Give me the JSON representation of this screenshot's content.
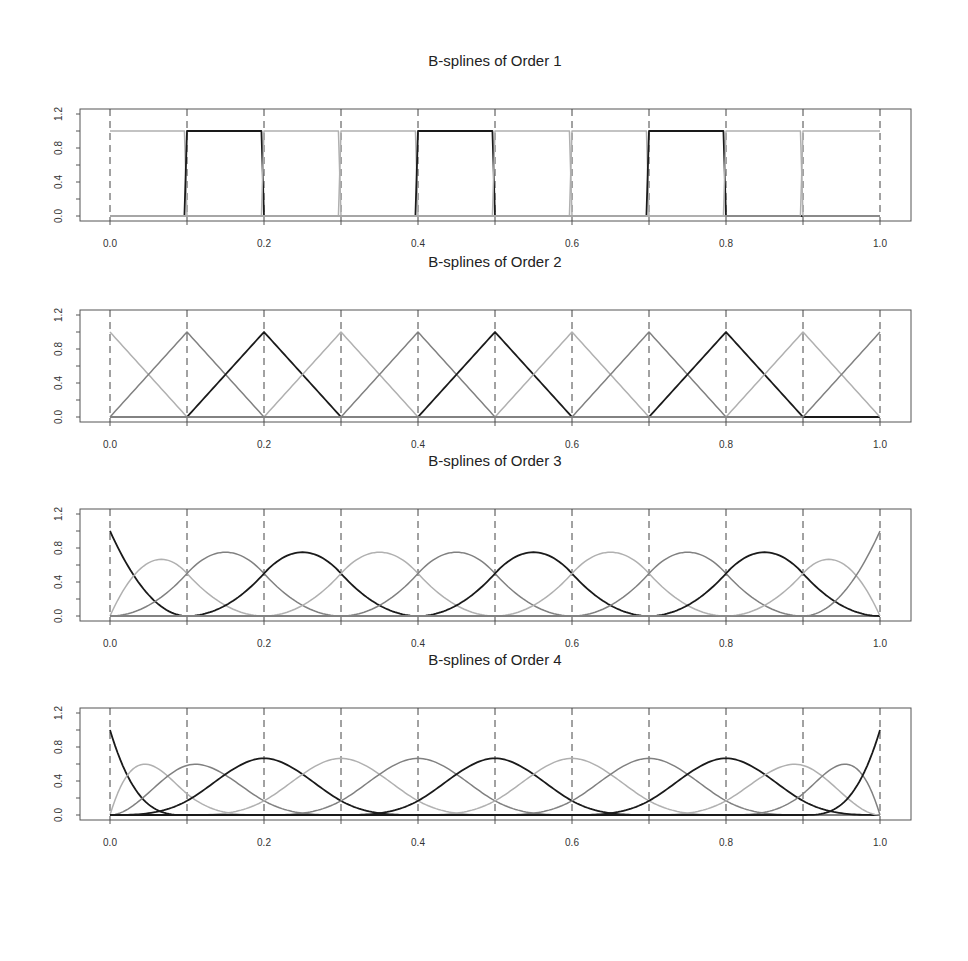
{
  "chart_data": [
    {
      "type": "line",
      "title": "B-splines of Order 1",
      "order": 1,
      "xlabel": "",
      "ylabel": "",
      "xlim": [
        0,
        1
      ],
      "ylim": [
        0,
        1.2
      ],
      "x_ticks": [
        "0.0",
        "0.2",
        "0.4",
        "0.6",
        "0.8",
        "1.0"
      ],
      "y_ticks": [
        "0.0",
        "0.4",
        "0.8",
        "1.2"
      ],
      "knots": [
        0.0,
        0.1,
        0.2,
        0.3,
        0.4,
        0.5,
        0.6,
        0.7,
        0.8,
        0.9,
        1.0
      ],
      "grid": "vertical dashed lines at knots",
      "n_basis": 10,
      "series_description": "Piecewise constant basis functions equal to 1 on [k_i, k_{i+1}) and 0 elsewhere; every third function drawn in black, others in grays",
      "peak_values": [
        1,
        1,
        1,
        1,
        1,
        1,
        1,
        1,
        1,
        1
      ]
    },
    {
      "type": "line",
      "title": "B-splines of Order 2",
      "order": 2,
      "xlabel": "",
      "ylabel": "",
      "xlim": [
        0,
        1
      ],
      "ylim": [
        0,
        1.2
      ],
      "x_ticks": [
        "0.0",
        "0.2",
        "0.4",
        "0.6",
        "0.8",
        "1.0"
      ],
      "y_ticks": [
        "0.0",
        "0.4",
        "0.8",
        "1.2"
      ],
      "knots": [
        0.0,
        0.1,
        0.2,
        0.3,
        0.4,
        0.5,
        0.6,
        0.7,
        0.8,
        0.9,
        1.0
      ],
      "grid": "vertical dashed lines at knots",
      "n_basis": 11,
      "series_description": "Piecewise linear hat functions peaking at 1.0 at each knot",
      "peak_x": [
        0.0,
        0.1,
        0.2,
        0.3,
        0.4,
        0.5,
        0.6,
        0.7,
        0.8,
        0.9,
        1.0
      ],
      "peak_values": [
        1,
        1,
        1,
        1,
        1,
        1,
        1,
        1,
        1,
        1,
        1
      ]
    },
    {
      "type": "line",
      "title": "B-splines of Order 3",
      "order": 3,
      "xlabel": "",
      "ylabel": "",
      "xlim": [
        0,
        1
      ],
      "ylim": [
        0,
        1.2
      ],
      "x_ticks": [
        "0.0",
        "0.2",
        "0.4",
        "0.6",
        "0.8",
        "1.0"
      ],
      "y_ticks": [
        "0.0",
        "0.4",
        "0.8",
        "1.2"
      ],
      "knots": [
        0.0,
        0.1,
        0.2,
        0.3,
        0.4,
        0.5,
        0.6,
        0.7,
        0.8,
        0.9,
        1.0
      ],
      "grid": "vertical dashed lines at knots",
      "n_basis": 12,
      "series_description": "Quadratic B-splines; boundary functions reach 1.0 at endpoints, next ones peak ~0.67, interior ones peak ~0.75",
      "peak_values": [
        1.0,
        0.67,
        0.75,
        0.75,
        0.75,
        0.75,
        0.75,
        0.75,
        0.75,
        0.75,
        0.67,
        1.0
      ]
    },
    {
      "type": "line",
      "title": "B-splines of Order 4",
      "order": 4,
      "xlabel": "",
      "ylabel": "",
      "xlim": [
        0,
        1
      ],
      "ylim": [
        0,
        1.2
      ],
      "x_ticks": [
        "0.0",
        "0.2",
        "0.4",
        "0.6",
        "0.8",
        "1.0"
      ],
      "y_ticks": [
        "0.0",
        "0.4",
        "0.8",
        "1.2"
      ],
      "knots": [
        0.0,
        0.1,
        0.2,
        0.3,
        0.4,
        0.5,
        0.6,
        0.7,
        0.8,
        0.9,
        1.0
      ],
      "grid": "vertical dashed lines at knots",
      "n_basis": 13,
      "series_description": "Cubic B-splines; boundary functions reach 1.0 at endpoints, second ones peak ~0.6, third ~0.6, interior ones peak ~0.67",
      "peak_values": [
        1.0,
        0.6,
        0.6,
        0.67,
        0.67,
        0.67,
        0.67,
        0.67,
        0.67,
        0.67,
        0.6,
        0.6,
        1.0
      ]
    }
  ],
  "panels": [
    {
      "title": "B-splines of Order 1"
    },
    {
      "title": "B-splines of Order 2"
    },
    {
      "title": "B-splines of Order 3"
    },
    {
      "title": "B-splines of Order 4"
    }
  ],
  "x_tick_labels": [
    "0.0",
    "0.2",
    "0.4",
    "0.6",
    "0.8",
    "1.0"
  ],
  "y_tick_labels": [
    "0.0",
    "0.4",
    "0.8",
    "1.2"
  ],
  "colors": {
    "black": "#1a1a1a",
    "dark_gray": "#808080",
    "light_gray": "#b0b0b0",
    "frame": "#555555",
    "knot_line": "#444444"
  }
}
